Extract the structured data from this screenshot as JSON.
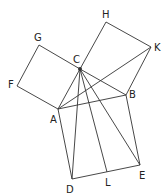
{
  "diagram": {
    "points": {
      "A": {
        "x": 58,
        "y": 109,
        "label": "A",
        "lx": 50,
        "ly": 123
      },
      "B": {
        "x": 126,
        "y": 95,
        "label": "B",
        "lx": 129,
        "ly": 98
      },
      "C": {
        "x": 80,
        "y": 69,
        "label": "C",
        "lx": 73,
        "ly": 63
      },
      "D": {
        "x": 72,
        "y": 179,
        "label": "D",
        "lx": 66,
        "ly": 193
      },
      "E": {
        "x": 140,
        "y": 165,
        "label": "E",
        "lx": 139,
        "ly": 179
      },
      "F": {
        "x": 17,
        "y": 86,
        "label": "F",
        "lx": 8,
        "ly": 88
      },
      "G": {
        "x": 39,
        "y": 45,
        "label": "G",
        "lx": 34,
        "ly": 41
      },
      "H": {
        "x": 106,
        "y": 22,
        "label": "H",
        "lx": 102,
        "ly": 18
      },
      "K": {
        "x": 151,
        "y": 47,
        "label": "K",
        "lx": 154,
        "ly": 51
      },
      "L": {
        "x": 107,
        "y": 172,
        "label": "L",
        "lx": 105,
        "ly": 186
      }
    },
    "segments": [
      [
        "A",
        "C"
      ],
      [
        "C",
        "B"
      ],
      [
        "A",
        "B"
      ],
      [
        "A",
        "F"
      ],
      [
        "F",
        "G"
      ],
      [
        "G",
        "C"
      ],
      [
        "C",
        "H"
      ],
      [
        "H",
        "K"
      ],
      [
        "K",
        "B"
      ],
      [
        "A",
        "D"
      ],
      [
        "D",
        "E"
      ],
      [
        "E",
        "B"
      ],
      [
        "A",
        "K"
      ],
      [
        "C",
        "D"
      ],
      [
        "C",
        "L"
      ],
      [
        "C",
        "E"
      ]
    ]
  }
}
